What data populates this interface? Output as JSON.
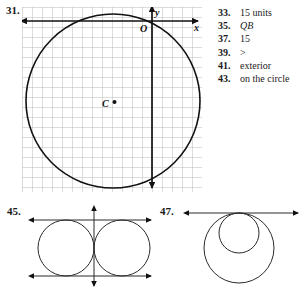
{
  "problems": {
    "p31": {
      "number": "31."
    },
    "p45": {
      "number": "45."
    },
    "p47": {
      "number": "47."
    }
  },
  "figure_31": {
    "type": "coordinate-grid-with-circle",
    "axis_labels": {
      "x": "x",
      "y": "y",
      "origin": "O"
    },
    "center_label": "C",
    "grid": {
      "cell_px": 10,
      "cols": 18,
      "rows": 18,
      "color": "#b9b9b9"
    },
    "circle": {
      "cx_px": 113,
      "cy_px": 101,
      "r_px": 87,
      "stroke": "#111111"
    },
    "origin_px": {
      "x": 152,
      "y": 21
    }
  },
  "answer_key": {
    "items": [
      {
        "number": "33.",
        "answer": "15 units",
        "italic": false
      },
      {
        "number": "35.",
        "answer": "QB",
        "italic": true
      },
      {
        "number": "37.",
        "answer": "15",
        "italic": false
      },
      {
        "number": "39.",
        "answer": ">",
        "italic": false
      },
      {
        "number": "41.",
        "answer": "exterior",
        "italic": false
      },
      {
        "number": "43.",
        "answer": "on the circle",
        "italic": false
      }
    ]
  },
  "figure_45": {
    "type": "two-tangent-circles-with-common-tangent-lines",
    "description": "Two congruent externally tangent circles with horizontal tangent lines above and below and a vertical line through the point of tangency"
  },
  "figure_47": {
    "type": "internally-tangent-circles-on-tangent-line",
    "description": "A large circle and a smaller circle internally tangent at the top, both touching a horizontal tangent line"
  },
  "colors": {
    "ink": "#111111",
    "grid": "#b9b9b9",
    "text": "#1a1a1a",
    "paper": "#ffffff"
  }
}
